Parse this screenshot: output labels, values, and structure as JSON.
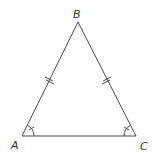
{
  "diagram": {
    "type": "isosceles-triangle",
    "vertices": {
      "A": {
        "label": "A"
      },
      "B": {
        "label": "B"
      },
      "C": {
        "label": "C"
      }
    },
    "congruent_sides": [
      "AB",
      "BC"
    ],
    "congruent_angles": [
      "A",
      "C"
    ],
    "stroke_color": "#4a4a4a",
    "label_color": "#333333"
  }
}
